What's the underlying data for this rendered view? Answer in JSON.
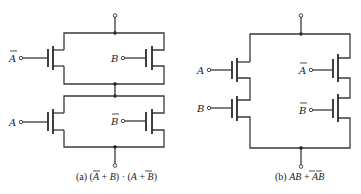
{
  "diagram": {
    "type": "CMOS switch networks",
    "colors": {
      "wire": "#3a3a3a",
      "background": "#ffffff",
      "text": "#222222"
    },
    "circuit_a": {
      "caption_prefix": "(a) ",
      "caption_expression": "(Ā + B) · (A + B̄)",
      "caption_parts": [
        "(a) (",
        "A",
        " + ",
        "B",
        ") · (",
        "A",
        " + ",
        "B",
        ")"
      ],
      "inputs": [
        {
          "label": "A",
          "negated": true,
          "position": "top-left"
        },
        {
          "label": "B",
          "negated": false,
          "position": "top-right"
        },
        {
          "label": "A",
          "negated": false,
          "position": "bottom-left"
        },
        {
          "label": "B",
          "negated": true,
          "position": "bottom-right"
        }
      ],
      "structure": "two parallel pairs in series"
    },
    "circuit_b": {
      "caption_prefix": "(b) ",
      "caption_expression": "AB + ĀB̄",
      "caption_parts": [
        "(b) ",
        "AB",
        " + ",
        "AB"
      ],
      "inputs": [
        {
          "label": "A",
          "negated": false,
          "position": "left-top"
        },
        {
          "label": "B",
          "negated": false,
          "position": "left-bottom"
        },
        {
          "label": "A",
          "negated": true,
          "position": "right-top"
        },
        {
          "label": "B",
          "negated": true,
          "position": "right-bottom"
        }
      ],
      "structure": "two series pairs in parallel"
    }
  }
}
